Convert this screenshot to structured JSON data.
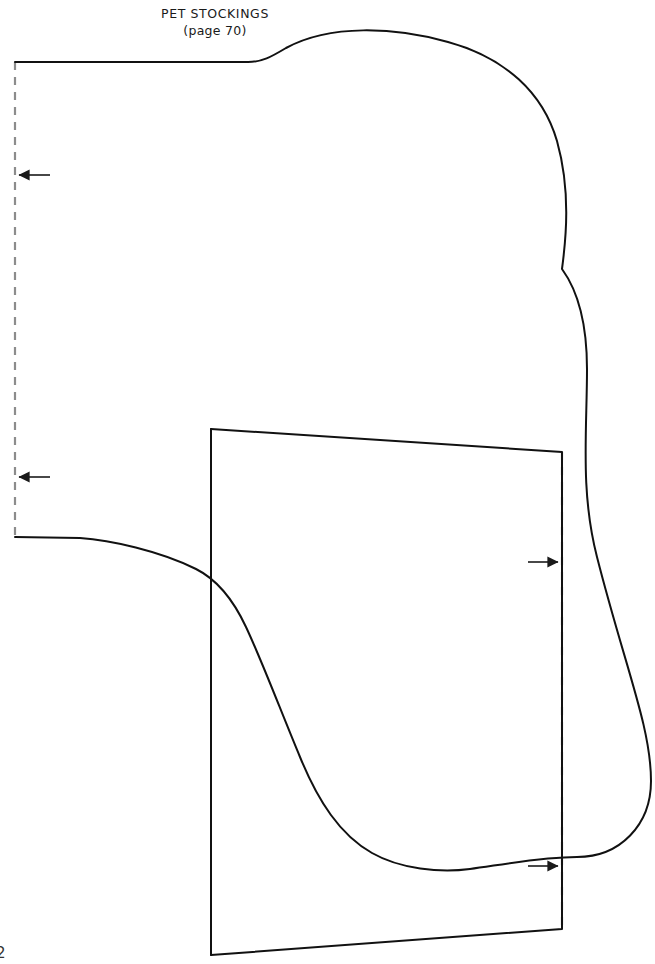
{
  "document": {
    "kind": "sewing-pattern-sheet",
    "title": "PET STOCKINGS",
    "subtitle": "(page 70)",
    "corner_mark": "2",
    "background_color": "#ffffff"
  },
  "styles": {
    "cut_line_color": "#111111",
    "cut_line_width": 2.0,
    "fold_line_color": "#8c8c8c",
    "fold_line_width": 2.2,
    "fold_dash_pattern": "8 7",
    "arrow_color": "#1a1a1a"
  },
  "pieces": [
    {
      "name": "stocking-body",
      "label": "stocking outer body cut line",
      "kind": "cut-line",
      "path": "M 15 62 L 248 62 C 262 62 272 58 288 49 C 330 26 392 28 447 42 C 505 57 542 92 556 140 C 570 190 566 238 562 268 C 578 290 586 320 586 368 C 586 430 580 490 596 556 C 624 666 650 726 650 780 C 650 824 620 856 576 856 C 540 856 500 864 470 868 C 440 872 400 868 372 852 C 340 834 318 800 300 756 C 280 708 262 660 246 626 C 232 596 216 578 196 568 C 160 550 110 540 80 538 L 15 537"
    },
    {
      "name": "stocking-cuff",
      "label": "stocking cuff / lining piece cut line",
      "kind": "cut-line",
      "path": "M 211 429 L 562 452 L 562 929 L 211 955 Z"
    }
  ],
  "fold_lines": [
    {
      "name": "left-fold-line",
      "label": "place on fold (left edge of body)",
      "x1": 15,
      "y1": 62,
      "x2": 15,
      "y2": 537
    },
    {
      "name": "right-fold-line",
      "label": "place on fold (right edge of cuff)",
      "x1": 562,
      "y1": 452,
      "x2": 562,
      "y2": 929
    }
  ],
  "fold_arrows": [
    {
      "name": "fold-arrow-left-upper",
      "direction": "left",
      "tip_x": 15,
      "tip_y": 175,
      "tail_x": 50,
      "tail_y": 175
    },
    {
      "name": "fold-arrow-left-lower",
      "direction": "left",
      "tip_x": 15,
      "tip_y": 477,
      "tail_x": 50,
      "tail_y": 477
    },
    {
      "name": "fold-arrow-right-upper",
      "direction": "right",
      "tip_x": 562,
      "tip_y": 562,
      "tail_x": 527,
      "tail_y": 562
    },
    {
      "name": "fold-arrow-right-lower",
      "direction": "right",
      "tip_x": 562,
      "tip_y": 866,
      "tail_x": 527,
      "tail_y": 866
    }
  ]
}
